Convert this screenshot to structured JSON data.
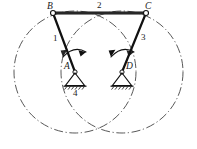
{
  "figure": {
    "caption": ""
  },
  "colors": {
    "ink": "#1a1a1a",
    "link_stroke": "#111111",
    "path_circle": "#3a3a3a",
    "ground_hatch": "#222222",
    "background": "#ffffff"
  },
  "joints": [
    {
      "id": "B",
      "label": "B",
      "type": "pin-joint-circle",
      "x": 53,
      "y": 13,
      "label_x": 47,
      "label_y": 2
    },
    {
      "id": "C",
      "label": "C",
      "type": "pin-joint-circle",
      "x": 146,
      "y": 13,
      "label_x": 145,
      "label_y": 2
    },
    {
      "id": "A",
      "label": "A",
      "type": "fixed-pivot",
      "x": 75,
      "y": 72,
      "label_x": 64,
      "label_y": 68
    },
    {
      "id": "D",
      "label": "D",
      "type": "fixed-pivot",
      "x": 122,
      "y": 72,
      "label_x": 126,
      "label_y": 68
    }
  ],
  "links": [
    {
      "id": "link-1",
      "label": "1",
      "from": "A",
      "to": "B",
      "label_x": 53,
      "label_y": 35
    },
    {
      "id": "link-2",
      "label": "2",
      "from": "B",
      "to": "C",
      "label_x": 97,
      "label_y": 2
    },
    {
      "id": "link-3",
      "label": "3",
      "from": "D",
      "to": "C",
      "label_x": 141,
      "label_y": 34
    },
    {
      "id": "link-4",
      "label": "4",
      "from": "A",
      "to": "D",
      "label_x": 73,
      "label_y": 88
    }
  ],
  "crank_paths": [
    {
      "id": "path-A",
      "center": "A",
      "cx": 75,
      "cy": 72,
      "r": 61,
      "style": "dash-dot"
    },
    {
      "id": "path-D",
      "center": "D",
      "cx": 122,
      "cy": 72,
      "r": 61,
      "style": "dash-dot"
    }
  ],
  "motion_arrows": [
    {
      "id": "rotation-arrow-1",
      "on_link": "link-1",
      "direction": "clockwise"
    },
    {
      "id": "rotation-arrow-3",
      "on_link": "link-3",
      "direction": "clockwise"
    }
  ]
}
